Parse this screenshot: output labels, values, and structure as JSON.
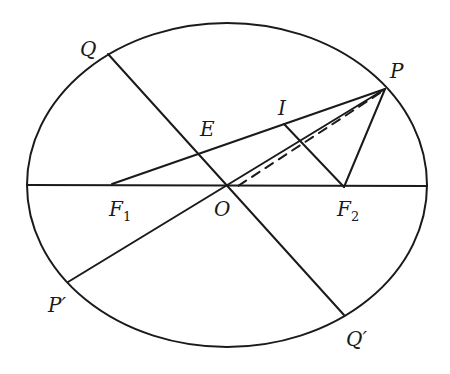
{
  "figure": {
    "type": "ellipse-geometry",
    "ellipse": {
      "cx": 227,
      "cy": 185,
      "rx": 200,
      "ry": 162
    },
    "points": {
      "P": {
        "label": "P",
        "x": 385,
        "y": 89
      },
      "Q": {
        "label": "Q",
        "x": 108,
        "y": 54
      },
      "Qp": {
        "label": "Q′",
        "x": 344,
        "y": 315
      },
      "Pp": {
        "label": "P′",
        "x": 68,
        "y": 282
      },
      "O": {
        "label": "O",
        "x": 227,
        "y": 186
      },
      "F1": {
        "label": "F",
        "sub": "1",
        "x": 112,
        "y": 184
      },
      "F2": {
        "label": "F",
        "sub": "2",
        "x": 344,
        "y": 187
      },
      "E": {
        "label": "E",
        "x": 197,
        "y": 153
      },
      "I": {
        "label": "I",
        "x": 284,
        "y": 124
      }
    },
    "segments": [
      {
        "name": "major-axis",
        "from": [
          27,
          185
        ],
        "to": [
          427,
          186
        ]
      },
      {
        "name": "diameter-PPp",
        "from": "P",
        "to": "Pp"
      },
      {
        "name": "diameter-QQp",
        "from": "Q",
        "to": "Qp"
      },
      {
        "name": "focal-radius-PF1",
        "from": "P",
        "to": "F1"
      },
      {
        "name": "focal-radius-PF2",
        "from": "P",
        "to": "F2"
      },
      {
        "name": "segment-IF2",
        "from": "I",
        "to": "F2"
      },
      {
        "name": "dashed-line",
        "from": "P",
        "to": [
          238,
          186
        ],
        "dashed": true
      }
    ]
  }
}
